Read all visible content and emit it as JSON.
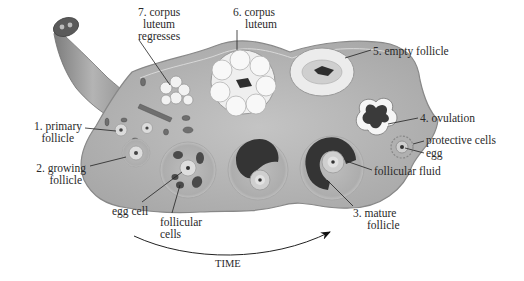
{
  "diagram": {
    "colors": {
      "ovary_fill": "#b9b9b9",
      "ovary_edge": "#8a8a8a",
      "tube": "#9a9a9a",
      "corpus_luteum": "#f2f2f2",
      "fluid": "#3a3a3a",
      "text": "#2a2a2a"
    },
    "labels": {
      "corpus_luteum_regresses": [
        "7. corpus",
        "luteum",
        "regresses"
      ],
      "corpus_luteum": [
        "6. corpus",
        "luteum"
      ],
      "empty_follicle": "5. empty follicle",
      "ovulation": "4. ovulation",
      "protective_cells": "protective cells",
      "egg": "egg",
      "follicular_fluid": "follicular fluid",
      "mature_follicle": [
        "3. mature",
        "follicle"
      ],
      "primary_follicle": [
        "1. primary",
        "follicle"
      ],
      "growing_follicle": [
        "2. growing",
        "follicle"
      ],
      "egg_cell": "egg cell",
      "follicular_cells": [
        "follicular",
        "cells"
      ],
      "time": "TIME"
    }
  }
}
